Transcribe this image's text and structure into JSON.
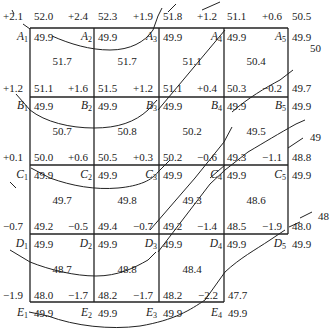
{
  "diagram": {
    "points": {
      "A": [
        {
          "id": "A1",
          "letter": "A",
          "num": "1",
          "design": "52.0",
          "existing": "49.9",
          "cut": "+2.1"
        },
        {
          "id": "A2",
          "letter": "A",
          "num": "2",
          "design": "52.3",
          "existing": "49.9",
          "cut": "+2.4"
        },
        {
          "id": "A3",
          "letter": "A",
          "num": "3",
          "design": "51.8",
          "existing": "49.9",
          "cut": "+1.9"
        },
        {
          "id": "A4",
          "letter": "A",
          "num": "4",
          "design": "51.1",
          "existing": "49.9",
          "cut": "+1.2"
        },
        {
          "id": "A5",
          "letter": "A",
          "num": "5",
          "design": "50.5",
          "existing": "49.9",
          "cut": "+0.6"
        }
      ],
      "B": [
        {
          "id": "B1",
          "letter": "B",
          "num": "1",
          "design": "51.1",
          "existing": "49.9",
          "cut": "+1.2"
        },
        {
          "id": "B2",
          "letter": "B",
          "num": "2",
          "design": "51.5",
          "existing": "49.9",
          "cut": "+1.6"
        },
        {
          "id": "B3",
          "letter": "B",
          "num": "3",
          "design": "51.1",
          "existing": "49.9",
          "cut": "+1.2"
        },
        {
          "id": "B4",
          "letter": "B",
          "num": "4",
          "design": "50.3",
          "existing": "49.9",
          "cut": "+0.4"
        },
        {
          "id": "B5",
          "letter": "B",
          "num": "5",
          "design": "49.7",
          "existing": "49.9",
          "cut": "−0.2"
        }
      ],
      "C": [
        {
          "id": "C1",
          "letter": "C",
          "num": "1",
          "design": "50.0",
          "existing": "49.9",
          "cut": "+0.1"
        },
        {
          "id": "C2",
          "letter": "C",
          "num": "2",
          "design": "50.5",
          "existing": "49.9",
          "cut": "+0.6"
        },
        {
          "id": "C3",
          "letter": "C",
          "num": "3",
          "design": "50.2",
          "existing": "49.9",
          "cut": "+0.3"
        },
        {
          "id": "C4",
          "letter": "C",
          "num": "4",
          "design": "49.3",
          "existing": "49.9",
          "cut": "−0.6"
        },
        {
          "id": "C5",
          "letter": "C",
          "num": "5",
          "design": "48.8",
          "existing": "49.9",
          "cut": "−1.1"
        }
      ],
      "D": [
        {
          "id": "D1",
          "letter": "D",
          "num": "1",
          "design": "49.2",
          "existing": "49.9",
          "cut": "−0.7"
        },
        {
          "id": "D2",
          "letter": "D",
          "num": "2",
          "design": "49.4",
          "existing": "49.9",
          "cut": "−0.5"
        },
        {
          "id": "D3",
          "letter": "D",
          "num": "3",
          "design": "49.2",
          "existing": "49.9",
          "cut": "−0.7"
        },
        {
          "id": "D4",
          "letter": "D",
          "num": "4",
          "design": "48.5",
          "existing": "49.9",
          "cut": "−1.4"
        },
        {
          "id": "D5",
          "letter": "D",
          "num": "5",
          "design": "48.0",
          "existing": "49.9",
          "cut": "−1.9"
        }
      ],
      "E": [
        {
          "id": "E1",
          "letter": "E",
          "num": "1",
          "design": "48.0",
          "existing": "49.9",
          "cut": "−1.9"
        },
        {
          "id": "E2",
          "letter": "E",
          "num": "2",
          "design": "48.2",
          "existing": "49.9",
          "cut": "−1.7"
        },
        {
          "id": "E3",
          "letter": "E",
          "num": "3",
          "design": "48.2",
          "existing": "49.9",
          "cut": "−1.7"
        },
        {
          "id": "E4",
          "letter": "E",
          "num": "4",
          "design": "47.7",
          "existing": "49.9",
          "cut": "−2.2"
        }
      ]
    },
    "cell_averages": [
      [
        "51.7",
        "51.7",
        "51.1",
        "50.4"
      ],
      [
        "50.7",
        "50.8",
        "50.2",
        "49.5"
      ],
      [
        "49.7",
        "49.8",
        "49.3",
        "48.6"
      ],
      [
        "48.7",
        "48.8",
        "48.4"
      ]
    ],
    "contour_labels": {
      "c50": "50",
      "c49": "49",
      "c48": "48"
    }
  }
}
